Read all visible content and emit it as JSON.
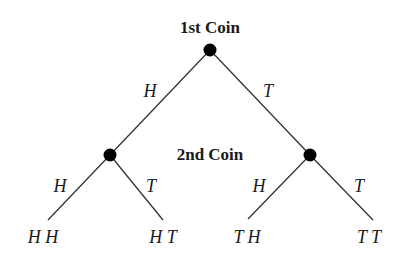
{
  "diagram": {
    "type": "probability-tree",
    "level_labels": {
      "first": "1st Coin",
      "second": "2nd Coin"
    },
    "branches": {
      "root_left": "H",
      "root_right": "T",
      "left_left": "H",
      "left_right": "T",
      "right_left": "H",
      "right_right": "T"
    },
    "outcomes": [
      "H H",
      "H T",
      "T H",
      "T T"
    ],
    "colors": {
      "line": "#333333",
      "node": "#000000",
      "text": "#1a1a1a"
    }
  }
}
